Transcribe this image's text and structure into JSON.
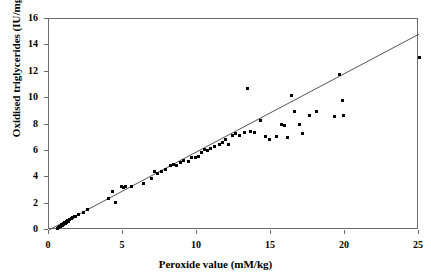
{
  "chart_data": {
    "type": "scatter",
    "title": "",
    "xlabel": "Peroxide value (mM/kg)",
    "ylabel": "Oxidised triglycerides (IU/mg/ml)",
    "xlim": [
      0,
      25
    ],
    "ylim": [
      0,
      16
    ],
    "xticks": [
      0,
      5,
      10,
      15,
      20,
      25
    ],
    "yticks": [
      0,
      2,
      4,
      6,
      8,
      10,
      12,
      14,
      16
    ],
    "grid": false,
    "legend": null,
    "marker": "square",
    "marker_color": "#000000",
    "trendline": {
      "type": "linear",
      "color": "#555555",
      "x_start": 0,
      "y_start": 0,
      "x_end": 25,
      "y_end": 14.85,
      "slope": 0.594,
      "intercept": 0
    },
    "points": [
      [
        0.55,
        0.15
      ],
      [
        0.65,
        0.2
      ],
      [
        0.7,
        0.3
      ],
      [
        0.8,
        0.25
      ],
      [
        0.85,
        0.4
      ],
      [
        0.9,
        0.35
      ],
      [
        0.95,
        0.5
      ],
      [
        1.0,
        0.45
      ],
      [
        1.05,
        0.55
      ],
      [
        1.1,
        0.5
      ],
      [
        1.15,
        0.65
      ],
      [
        1.2,
        0.6
      ],
      [
        1.25,
        0.7
      ],
      [
        1.3,
        0.75
      ],
      [
        1.35,
        0.65
      ],
      [
        1.4,
        0.8
      ],
      [
        1.5,
        0.85
      ],
      [
        1.6,
        0.95
      ],
      [
        1.7,
        1.0
      ],
      [
        1.8,
        1.05
      ],
      [
        2.0,
        1.2
      ],
      [
        2.3,
        1.35
      ],
      [
        2.6,
        1.55
      ],
      [
        4.0,
        2.4
      ],
      [
        4.3,
        2.9
      ],
      [
        4.5,
        2.1
      ],
      [
        4.9,
        3.3
      ],
      [
        5.0,
        3.25
      ],
      [
        5.2,
        3.3
      ],
      [
        5.6,
        3.3
      ],
      [
        6.4,
        3.5
      ],
      [
        6.9,
        3.9
      ],
      [
        7.1,
        4.4
      ],
      [
        7.3,
        4.3
      ],
      [
        7.6,
        4.4
      ],
      [
        7.9,
        4.6
      ],
      [
        8.2,
        4.9
      ],
      [
        8.4,
        5.0
      ],
      [
        8.6,
        4.9
      ],
      [
        8.9,
        5.1
      ],
      [
        9.1,
        5.3
      ],
      [
        9.4,
        5.2
      ],
      [
        9.6,
        5.5
      ],
      [
        9.9,
        5.5
      ],
      [
        10.1,
        5.6
      ],
      [
        10.3,
        5.9
      ],
      [
        10.5,
        6.1
      ],
      [
        10.7,
        6.0
      ],
      [
        10.9,
        6.2
      ],
      [
        11.2,
        6.3
      ],
      [
        11.5,
        6.5
      ],
      [
        11.7,
        6.6
      ],
      [
        11.9,
        6.9
      ],
      [
        12.1,
        6.5
      ],
      [
        12.4,
        7.2
      ],
      [
        12.6,
        7.3
      ],
      [
        12.9,
        7.2
      ],
      [
        13.2,
        7.4
      ],
      [
        13.4,
        10.7
      ],
      [
        13.6,
        7.5
      ],
      [
        13.9,
        7.4
      ],
      [
        14.3,
        8.3
      ],
      [
        14.6,
        7.1
      ],
      [
        14.9,
        6.9
      ],
      [
        15.4,
        7.1
      ],
      [
        15.7,
        8.0
      ],
      [
        15.9,
        7.9
      ],
      [
        16.1,
        7.0
      ],
      [
        16.4,
        10.2
      ],
      [
        16.6,
        9.0
      ],
      [
        16.9,
        8.0
      ],
      [
        17.1,
        7.3
      ],
      [
        17.6,
        8.7
      ],
      [
        18.1,
        9.0
      ],
      [
        19.3,
        8.6
      ],
      [
        19.6,
        11.8
      ],
      [
        19.8,
        9.8
      ],
      [
        19.9,
        8.7
      ],
      [
        25.0,
        13.1
      ]
    ]
  }
}
